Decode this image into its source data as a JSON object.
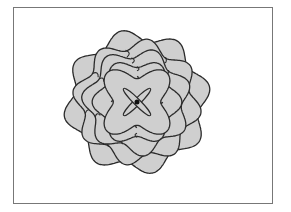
{
  "figure": {
    "type": "layered rose curve flower",
    "frame_color": "#777777",
    "petal_fill": "#cfcfcf",
    "outline_color": "#2b2b2b",
    "center": [
      137,
      102
    ],
    "layers": [
      {
        "name": "outer",
        "lobes": 8,
        "radius": 68,
        "amp": 0.09,
        "rotation": 12
      },
      {
        "name": "layer-2",
        "lobes": 8,
        "radius": 59,
        "amp": 0.1,
        "rotation": -10
      },
      {
        "name": "layer-3",
        "lobes": 7,
        "radius": 50,
        "amp": 0.11,
        "rotation": 20
      },
      {
        "name": "layer-4",
        "lobes": 6,
        "radius": 40,
        "amp": 0.12,
        "rotation": 0
      },
      {
        "name": "inner-star",
        "lobes": 4,
        "radius": 33,
        "amp": 0.28,
        "rotation": 45
      }
    ],
    "center_petals": 2
  }
}
